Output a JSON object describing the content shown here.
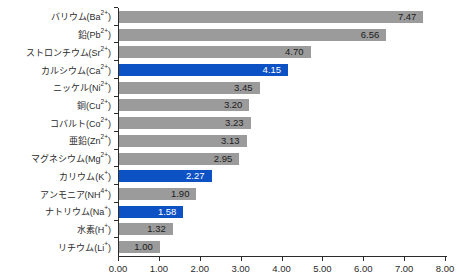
{
  "chart_data": {
    "type": "bar",
    "orientation": "horizontal",
    "title": "",
    "xlabel": "",
    "ylabel": "",
    "xlim": [
      0,
      8
    ],
    "grid": false,
    "legend": false,
    "x_ticks": [
      "0.00",
      "1.00",
      "2.00",
      "3.00",
      "4.00",
      "5.00",
      "6.00",
      "7.00",
      "8.00"
    ],
    "categories": [
      {
        "name": "バリウム",
        "formula": "Ba",
        "charge": "2+"
      },
      {
        "name": "鉛",
        "formula": "Pb",
        "charge": "2+"
      },
      {
        "name": "ストロンチウム",
        "formula": "Sr",
        "charge": "2+"
      },
      {
        "name": "カルシウム",
        "formula": "Ca",
        "charge": "2+"
      },
      {
        "name": "ニッケル",
        "formula": "Ni",
        "charge": "2+"
      },
      {
        "name": "銅",
        "formula": "Cu",
        "charge": "2+"
      },
      {
        "name": "コバルト",
        "formula": "Co",
        "charge": "2+"
      },
      {
        "name": "亜鉛",
        "formula": "Zn",
        "charge": "2+"
      },
      {
        "name": "マグネシウム",
        "formula": "Mg",
        "charge": "2+"
      },
      {
        "name": "カリウム",
        "formula": "K",
        "charge": "+"
      },
      {
        "name": "アンモニア",
        "formula": "NH",
        "charge": "4+"
      },
      {
        "name": "ナトリウム",
        "formula": "Na",
        "charge": "+"
      },
      {
        "name": "水素",
        "formula": "H",
        "charge": "+"
      },
      {
        "name": "リチウム",
        "formula": "Li",
        "charge": "+"
      }
    ],
    "values": [
      7.47,
      6.56,
      4.7,
      4.15,
      3.45,
      3.2,
      3.23,
      3.13,
      2.95,
      2.27,
      1.9,
      1.58,
      1.32,
      1.0
    ],
    "value_labels": [
      "7.47",
      "6.56",
      "4.70",
      "4.15",
      "3.45",
      "3.20",
      "3.23",
      "3.13",
      "2.95",
      "2.27",
      "1.90",
      "1.58",
      "1.32",
      "1.00"
    ],
    "highlighted_indices": [
      3,
      9,
      11
    ],
    "colors": {
      "bar_default": "#9b9b9b",
      "bar_highlight": "#0d52c4",
      "value_text_default": "#1c1c1c",
      "value_text_highlight": "#ffffff",
      "axis": "#2b2b2b"
    }
  }
}
